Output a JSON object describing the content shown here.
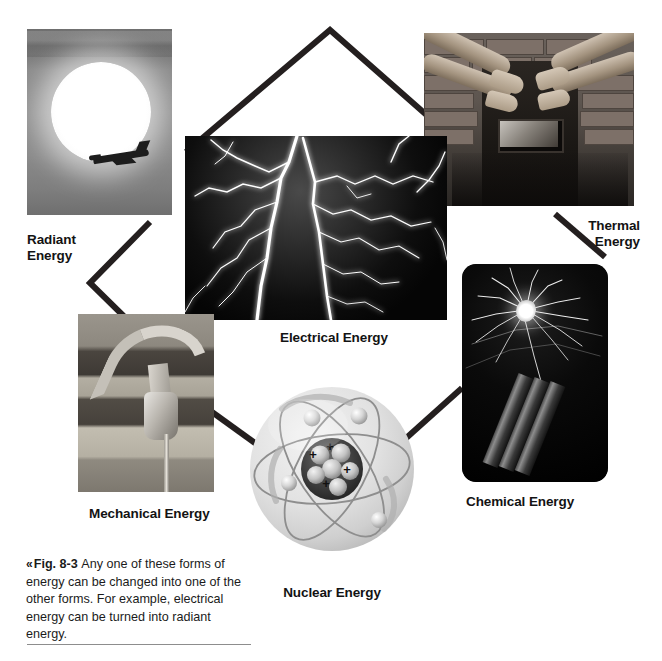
{
  "figure": {
    "caption": {
      "chevron": "«",
      "fig_number": "Fig. 8-3",
      "text": "Any one of these forms of energy can be changed into one of the other forms. For example, electrical energy can be turned into radiant energy."
    }
  },
  "labels": {
    "radiant": "Radiant\nEnergy",
    "thermal": "Thermal\nEnergy",
    "electrical": "Electrical Energy",
    "mechanical": "Mechanical Energy",
    "chemical": "Chemical Energy",
    "nuclear": "Nuclear Energy"
  },
  "photos": {
    "radiant": "sun-with-airplane-silhouette-photo",
    "electrical": "lightning-bolts-photo",
    "thermal": "hands-warming-at-wood-stove-photo",
    "mechanical": "hammer-and-nail-in-wood-photo",
    "chemical": "dynamite-sticks-with-lit-fuse-photo"
  },
  "atom": {
    "name": "nuclear-atom-illustration",
    "nucleus_charges": [
      "+",
      "+",
      "+",
      "+"
    ],
    "electron_count": 4,
    "orbit_count": 3
  },
  "colors": {
    "connector_line": "#241f1f",
    "label_text": "#131313",
    "caption_text": "#1b1b1b",
    "caption_rule": "#8d8d8d",
    "page_background": "#ffffff",
    "atom_sphere": "#dcdcdc",
    "atom_nucleus": "#3c3c3c"
  }
}
